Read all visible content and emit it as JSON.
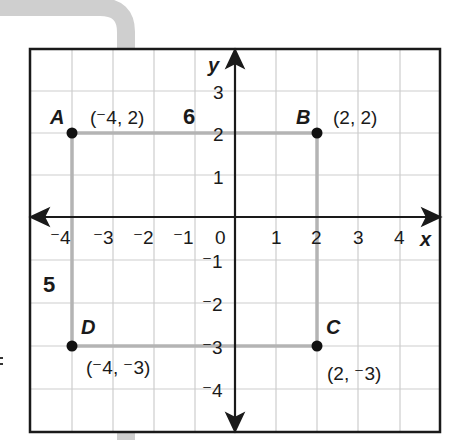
{
  "axes": {
    "x_label": "x",
    "y_label": "y",
    "x_ticks": [
      {
        "label": "⁻4",
        "value": -4
      },
      {
        "label": "⁻3",
        "value": -3
      },
      {
        "label": "⁻2",
        "value": -2
      },
      {
        "label": "⁻1",
        "value": -1
      },
      {
        "label": "0",
        "value": 0
      },
      {
        "label": "1",
        "value": 1
      },
      {
        "label": "2",
        "value": 2
      },
      {
        "label": "3",
        "value": 3
      },
      {
        "label": "4",
        "value": 4
      }
    ],
    "y_ticks": [
      {
        "label": "3",
        "value": 3
      },
      {
        "label": "2",
        "value": 2
      },
      {
        "label": "1",
        "value": 1
      },
      {
        "label": "⁻1",
        "value": -1
      },
      {
        "label": "⁻2",
        "value": -2
      },
      {
        "label": "⁻3",
        "value": -3
      },
      {
        "label": "⁻4",
        "value": -4
      }
    ]
  },
  "points": {
    "A": {
      "name": "A",
      "coord": "(⁻4, 2)",
      "x": -4,
      "y": 2
    },
    "B": {
      "name": "B",
      "coord": "(2, 2)",
      "x": 2,
      "y": 2
    },
    "C": {
      "name": "C",
      "coord": "(2, ⁻3)",
      "x": 2,
      "y": -3
    },
    "D": {
      "name": "D",
      "coord": "(⁻4, ⁻3)",
      "x": -4,
      "y": -3
    }
  },
  "side_lengths": {
    "top": "6",
    "left": "5"
  },
  "colors": {
    "grid": "#c8c8c8",
    "rectangle": "#b4b4b4",
    "axes": "#1a1a1a",
    "tab": "#cfcfcf"
  }
}
